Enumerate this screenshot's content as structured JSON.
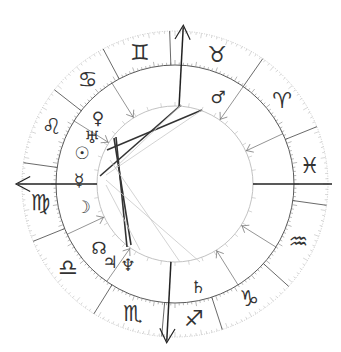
{
  "chart": {
    "center": [
      175,
      184
    ],
    "r_outer": 153,
    "r_zodiac_inner": 119,
    "r_inner": 78,
    "colors": {
      "line": "#444444",
      "light": "#bbbbbb",
      "glyph": "#333333",
      "aspect_dark": "#333333",
      "aspect_light": "#c8c8c8"
    }
  },
  "zodiac": [
    {
      "name": "gemini",
      "symbol": "♊",
      "angle": 105
    },
    {
      "name": "taurus",
      "symbol": "♉",
      "angle": 72
    },
    {
      "name": "aries",
      "symbol": "♈",
      "angle": 38
    },
    {
      "name": "pisces",
      "symbol": "♓",
      "angle": 8
    },
    {
      "name": "aquarius",
      "symbol": "♒",
      "angle": -25
    },
    {
      "name": "capricorn",
      "symbol": "♑",
      "angle": -57
    },
    {
      "name": "sagittarius",
      "symbol": "♐",
      "angle": -82
    },
    {
      "name": "scorpio",
      "symbol": "♏",
      "angle": -108
    },
    {
      "name": "libra",
      "symbol": "♎",
      "angle": -142
    },
    {
      "name": "virgo",
      "symbol": "♍",
      "angle": -172
    },
    {
      "name": "leo",
      "symbol": "♌",
      "angle": 155
    },
    {
      "name": "cancer",
      "symbol": "♋",
      "angle": 130
    }
  ],
  "sign_cusps": [
    92,
    55,
    22,
    -8,
    -42,
    -72,
    -95,
    -122,
    -158,
    172,
    142,
    118
  ],
  "house_cusps": [
    {
      "angle": 180,
      "axis": "asc"
    },
    {
      "angle": 148
    },
    {
      "angle": 122
    },
    {
      "angle": 87,
      "axis": "mc"
    },
    {
      "angle": 55
    },
    {
      "angle": 25
    },
    {
      "angle": 0,
      "axis": "dsc"
    },
    {
      "angle": -32
    },
    {
      "angle": -58
    },
    {
      "angle": -93,
      "axis": "ic"
    },
    {
      "angle": -125
    },
    {
      "angle": -155
    }
  ],
  "planets": [
    {
      "name": "mars",
      "symbol": "♂",
      "x": 218,
      "y": 97
    },
    {
      "name": "venus",
      "symbol": "♀",
      "x": 98,
      "y": 118
    },
    {
      "name": "uranus",
      "symbol": "♅",
      "x": 92,
      "y": 137
    },
    {
      "name": "sun",
      "symbol": "☉",
      "x": 82,
      "y": 153
    },
    {
      "name": "mercury",
      "symbol": "☿",
      "x": 79,
      "y": 180
    },
    {
      "name": "moon",
      "symbol": "☽",
      "x": 83,
      "y": 207
    },
    {
      "name": "north-node",
      "symbol": "☊",
      "x": 99,
      "y": 248
    },
    {
      "name": "jupiter",
      "symbol": "♃",
      "x": 110,
      "y": 262
    },
    {
      "name": "neptune",
      "symbol": "♆",
      "x": 128,
      "y": 265
    },
    {
      "name": "saturn",
      "symbol": "♄",
      "x": 198,
      "y": 287
    }
  ],
  "aspects": [
    {
      "from": [
        114,
        138
      ],
      "to": [
        131,
        245
      ],
      "weight": "dark"
    },
    {
      "from": [
        116,
        137
      ],
      "to": [
        127,
        247
      ],
      "weight": "dark"
    },
    {
      "from": [
        107,
        150
      ],
      "to": [
        202,
        110
      ],
      "weight": "dark"
    },
    {
      "from": [
        100,
        176
      ],
      "to": [
        181,
        105
      ],
      "weight": "dark"
    },
    {
      "from": [
        181,
        105
      ],
      "to": [
        115,
        168
      ],
      "weight": "light"
    },
    {
      "from": [
        202,
        110
      ],
      "to": [
        106,
        175
      ],
      "weight": "light"
    },
    {
      "from": [
        106,
        180
      ],
      "to": [
        200,
        262
      ],
      "weight": "light"
    },
    {
      "from": [
        106,
        185
      ],
      "to": [
        140,
        250
      ],
      "weight": "light"
    },
    {
      "from": [
        110,
        160
      ],
      "to": [
        180,
        262
      ],
      "weight": "light"
    }
  ]
}
